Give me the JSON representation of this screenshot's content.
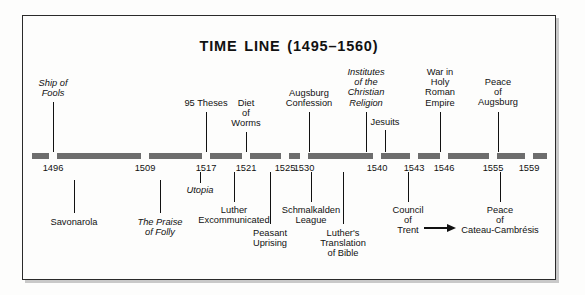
{
  "document": {
    "title": "TIME LINE (1495–1560)",
    "range_start": 1495,
    "range_end": 1560
  },
  "chart_data": {
    "type": "timeline",
    "title": "TIME LINE (1495–1560)",
    "xlabel": "",
    "ylabel": "",
    "xlim": [
      1495,
      1560
    ],
    "grid": false,
    "legend": false,
    "axis_ticks": [
      1496,
      1509,
      1517,
      1521,
      1525,
      1530,
      1540,
      1543,
      1546,
      1555,
      1559
    ],
    "events_above": [
      {
        "year": 1496,
        "label": "Ship of\nFools",
        "italic": true
      },
      {
        "year": 1517,
        "label": "95 Theses",
        "italic": false
      },
      {
        "year": 1521,
        "label": "Diet\nof\nWorms",
        "italic": false
      },
      {
        "year": 1530,
        "label": "Augsburg\nConfession",
        "italic": false
      },
      {
        "year": 1536,
        "label": "Institutes\nof the\nChristian\nReligion",
        "italic": true
      },
      {
        "year": 1540,
        "label": "Jesuits",
        "italic": false
      },
      {
        "year": 1546,
        "label": "War in\nHoly\nRoman\nEmpire",
        "italic": false
      },
      {
        "year": 1555,
        "label": "Peace\nof\nAugsburg",
        "italic": false
      }
    ],
    "events_below": [
      {
        "year": 1498,
        "label": "Savonarola",
        "italic": false
      },
      {
        "year": 1509,
        "label": "The Praise\nof Folly",
        "italic": true
      },
      {
        "year": 1516,
        "label": "Utopia",
        "italic": true
      },
      {
        "year": 1521,
        "label": "Luther\nExcommunicated",
        "italic": false
      },
      {
        "year": 1525,
        "label": "Peasant\nUprising",
        "italic": false
      },
      {
        "year": 1531,
        "label": "Schmalkalden\nLeague",
        "italic": false
      },
      {
        "year": 1534,
        "label": "Luther's\nTranslation\nof Bible",
        "italic": false
      },
      {
        "year": 1543,
        "label": "Council\nof\nTrent",
        "italic": false,
        "arrow": true
      },
      {
        "year": 1559,
        "label": "Peace\nof\nCateau-Cambrésis",
        "italic": false
      }
    ]
  },
  "dates": [
    {
      "value": "1496",
      "x": 53
    },
    {
      "value": "1509",
      "x": 145
    },
    {
      "value": "1517",
      "x": 206
    },
    {
      "value": "1521",
      "x": 246
    },
    {
      "value": "1525",
      "x": 285
    },
    {
      "value": "1530",
      "x": 304
    },
    {
      "value": "1540",
      "x": 377
    },
    {
      "value": "1543",
      "x": 414
    },
    {
      "value": "1546",
      "x": 444
    },
    {
      "value": "1555",
      "x": 493
    },
    {
      "value": "1559",
      "x": 529
    }
  ],
  "labels_above": [
    {
      "id": "ship-of-fools",
      "text": "Ship of\nFools",
      "italic": true,
      "x": 53,
      "top": 78,
      "leader_top": 102,
      "leader_h": 50
    },
    {
      "id": "ninety-five-theses",
      "text": "95 Theses",
      "italic": false,
      "x": 206,
      "top": 98,
      "leader_top": 112,
      "leader_h": 40
    },
    {
      "id": "diet-of-worms",
      "text": "Diet\nof\nWorms",
      "italic": false,
      "x": 246,
      "top": 98,
      "leader_top": 132,
      "leader_h": 20
    },
    {
      "id": "augsburg-confession",
      "text": "Augsburg\nConfession",
      "italic": false,
      "x": 309,
      "top": 88,
      "leader_top": 112,
      "leader_h": 40
    },
    {
      "id": "institutes",
      "text": "Institutes\nof the\nChristian\nReligion",
      "italic": true,
      "x": 366,
      "top": 67,
      "leader_top": 112,
      "leader_h": 40
    },
    {
      "id": "jesuits",
      "text": "Jesuits",
      "italic": false,
      "x": 385,
      "top": 117,
      "leader_top": 130,
      "leader_h": 22
    },
    {
      "id": "war-holy-roman",
      "text": "War in\nHoly\nRoman\nEmpire",
      "italic": false,
      "x": 440,
      "top": 67,
      "leader_top": 112,
      "leader_h": 40
    },
    {
      "id": "peace-of-augsburg",
      "text": "Peace\nof\nAugsburg",
      "italic": false,
      "x": 498,
      "top": 77,
      "leader_top": 112,
      "leader_h": 40
    }
  ],
  "labels_below": [
    {
      "id": "savonarola",
      "text": "Savonarola",
      "italic": false,
      "x": 74,
      "top": 217,
      "leader_top": 180,
      "leader_h": 33
    },
    {
      "id": "praise-of-folly",
      "text": "The Praise\nof Folly",
      "italic": true,
      "x": 160,
      "top": 217,
      "leader_top": 180,
      "leader_h": 33
    },
    {
      "id": "utopia",
      "text": "Utopia",
      "italic": true,
      "x": 200,
      "top": 185,
      "leader_top": 172,
      "leader_h": 11
    },
    {
      "id": "luther-excommunicated",
      "text": "Luther\nExcommunicated",
      "italic": false,
      "x": 234,
      "top": 205,
      "leader_top": 172,
      "leader_h": 30
    },
    {
      "id": "peasant-uprising",
      "text": "Peasant\nUprising",
      "italic": false,
      "x": 270,
      "top": 228,
      "leader_top": 172,
      "leader_h": 52
    },
    {
      "id": "schmalkalden-league",
      "text": "Schmalkalden\nLeague",
      "italic": false,
      "x": 311,
      "top": 205,
      "leader_top": 172,
      "leader_h": 30
    },
    {
      "id": "luther-translation",
      "text": "Luther's\nTranslation\nof Bible",
      "italic": false,
      "x": 343,
      "top": 228,
      "leader_top": 172,
      "leader_h": 52
    },
    {
      "id": "council-of-trent",
      "text": "Council\nof\nTrent",
      "italic": false,
      "x": 408,
      "top": 205,
      "leader_top": 172,
      "leader_h": 30
    },
    {
      "id": "peace-cateau",
      "text": "Peace\nof\nCateau-Cambrésis",
      "italic": false,
      "x": 500,
      "top": 205,
      "leader_top": 172,
      "leader_h": 30
    }
  ],
  "bar_segments": [
    {
      "left": 32,
      "width": 17
    },
    {
      "left": 57,
      "width": 84
    },
    {
      "left": 149,
      "width": 53
    },
    {
      "left": 210,
      "width": 32
    },
    {
      "left": 250,
      "width": 31
    },
    {
      "left": 289,
      "width": 11
    },
    {
      "left": 308,
      "width": 65
    },
    {
      "left": 381,
      "width": 29
    },
    {
      "left": 418,
      "width": 22
    },
    {
      "left": 448,
      "width": 41
    },
    {
      "left": 497,
      "width": 28
    },
    {
      "left": 533,
      "width": 14
    }
  ],
  "colors": {
    "bar": "#6d6d6d",
    "ink": "#111111",
    "frame": "#2a2a2a",
    "paper": "#fdfdfc"
  }
}
